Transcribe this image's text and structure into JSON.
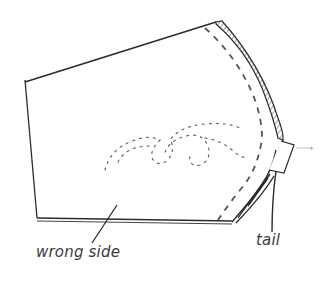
{
  "diagram": {
    "type": "sewing-illustration",
    "labels": {
      "wrong_side": "wrong side",
      "tail": "tail"
    },
    "colors": {
      "stroke": "#2b2b2b",
      "stitch": "#555555",
      "hatch": "#6a6a6a",
      "background": "#ffffff"
    },
    "elements": [
      "fabric-panel",
      "curved-seam-stitch-line",
      "hatched-seam-allowance",
      "bottom-hem-edge",
      "loose-thread-squiggle",
      "thread-tail-tab"
    ]
  }
}
